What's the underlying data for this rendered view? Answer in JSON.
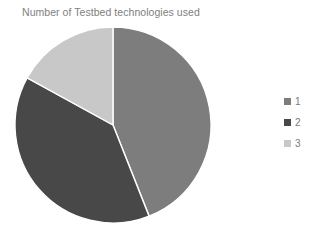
{
  "chart_data": {
    "type": "pie",
    "title": "Number of Testbed technologies used",
    "xlabel": "",
    "ylabel": "",
    "legend_position": "right",
    "grid": false,
    "categories": [
      "1",
      "2",
      "3"
    ],
    "values": [
      44,
      39,
      17
    ],
    "slices": [
      {
        "label": "1",
        "value": 44,
        "color": "#7d7d7d",
        "start_angle": 0,
        "end_angle": 158.4
      },
      {
        "label": "2",
        "value": 39,
        "color": "#484848",
        "start_angle": 158.4,
        "end_angle": 298.8
      },
      {
        "label": "3",
        "value": 17,
        "color": "#c8c8c8",
        "start_angle": 298.8,
        "end_angle": 360
      }
    ],
    "colors": [
      "#7d7d7d",
      "#484848",
      "#c8c8c8"
    ],
    "title_color": "#808080",
    "background_color": "#ffffff"
  },
  "legend": {
    "items": [
      {
        "label": "1",
        "color": "#7d7d7d"
      },
      {
        "label": "2",
        "color": "#484848"
      },
      {
        "label": "3",
        "color": "#c8c8c8"
      }
    ]
  }
}
